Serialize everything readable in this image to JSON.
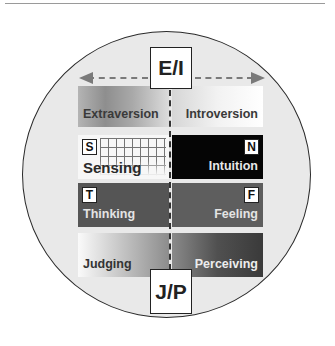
{
  "diagram": {
    "axes": {
      "top": "E/I",
      "bottom": "J/P"
    },
    "rows": [
      {
        "left": {
          "label": "Extraversion",
          "letter": null
        },
        "right": {
          "label": "Introversion",
          "letter": null
        }
      },
      {
        "left": {
          "label": "Sensing",
          "letter": "S"
        },
        "right": {
          "label": "Intuition",
          "letter": "N"
        }
      },
      {
        "left": {
          "label": "Thinking",
          "letter": "T"
        },
        "right": {
          "label": "Feeling",
          "letter": "F"
        }
      },
      {
        "left": {
          "label": "Judging",
          "letter": null
        },
        "right": {
          "label": "Perceiving",
          "letter": null
        }
      }
    ],
    "colors": {
      "circle_fill": "#e9e9e9",
      "circle_border": "#2a2a2a",
      "intuition_fill": "#050505",
      "thinking_fill": "#555555",
      "feeling_fill": "#5e5e5e",
      "arrow": "#7a7a7a"
    }
  }
}
